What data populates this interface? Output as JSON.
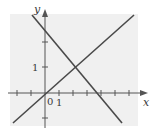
{
  "figure": {
    "background_color": "#f0f0f0",
    "axis_color": "#555555",
    "line_color": "#4a4a4a",
    "axes": {
      "x_label": "x",
      "y_label": "y",
      "origin_label": "0",
      "x_tick_label": "1",
      "y_tick_label": "1",
      "x_ticks": [
        -2,
        -1,
        1,
        2,
        3,
        4,
        5,
        6
      ],
      "y_ticks": [
        -1,
        1,
        2
      ]
    },
    "lines": [
      {
        "name": "rising-line",
        "description": "passes through origin and (2,1)",
        "slope": 0.5,
        "intercept": 0
      },
      {
        "name": "falling-line",
        "description": "passes through (2,1), crosses x-axis near 3.5",
        "slope": -0.667,
        "intercept": 2.33
      }
    ],
    "intersection": {
      "x": 2,
      "y": 1
    }
  }
}
